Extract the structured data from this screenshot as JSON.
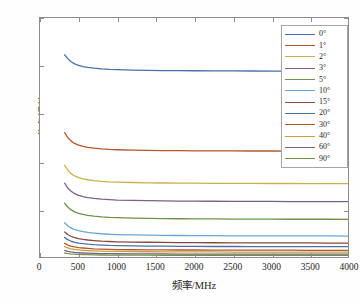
{
  "chart_data": {
    "type": "line",
    "title": "",
    "xlabel": "频率/MHz",
    "ylabel": "仰角误差/mrad",
    "xlim": [
      0,
      4000
    ],
    "ylim": [
      0,
      25
    ],
    "xticks": [
      0,
      500,
      1000,
      1500,
      2000,
      2500,
      3000,
      3500,
      4000
    ],
    "xticklabels": [
      "0",
      "500",
      "1000",
      "1500",
      "2000",
      "2500",
      "3000",
      "3500",
      "4000"
    ],
    "yticks": [
      0,
      5,
      10,
      15,
      20,
      25
    ],
    "yticklabels": [
      "0",
      "5",
      "10",
      "15",
      "20",
      "25"
    ],
    "grid": false,
    "legend_position": "top-right",
    "x": [
      320,
      360,
      400,
      450,
      500,
      560,
      620,
      700,
      800,
      900,
      1000,
      1200,
      1400,
      1600,
      1800,
      2000,
      2250,
      2500,
      2750,
      3000,
      3250,
      3500,
      3750,
      4000
    ],
    "series": [
      {
        "name": "0°",
        "label": "0°",
        "color": "#4a6fa8",
        "values": [
          21.15,
          20.75,
          20.45,
          20.2,
          20.05,
          19.92,
          19.84,
          19.76,
          19.68,
          19.63,
          19.6,
          19.55,
          19.52,
          19.5,
          19.49,
          19.48,
          19.47,
          19.46,
          19.455,
          19.45,
          19.45,
          19.45,
          19.44,
          19.44
        ]
      },
      {
        "name": "1°",
        "label": "1°",
        "color": "#b5562a",
        "values": [
          13.0,
          12.5,
          12.15,
          11.88,
          11.7,
          11.56,
          11.47,
          11.38,
          11.3,
          11.25,
          11.22,
          11.18,
          11.15,
          11.13,
          11.12,
          11.11,
          11.1,
          11.1,
          11.09,
          11.09,
          11.08,
          11.08,
          11.08,
          11.07
        ]
      },
      {
        "name": "2°",
        "label": "2°",
        "color": "#c9b24c",
        "values": [
          9.6,
          9.1,
          8.75,
          8.48,
          8.3,
          8.17,
          8.08,
          7.99,
          7.91,
          7.86,
          7.83,
          7.79,
          7.76,
          7.74,
          7.73,
          7.72,
          7.71,
          7.7,
          7.7,
          7.69,
          7.69,
          7.68,
          7.68,
          7.68
        ]
      },
      {
        "name": "3°",
        "label": "3°",
        "color": "#7a5f8e",
        "values": [
          7.72,
          7.22,
          6.9,
          6.62,
          6.45,
          6.32,
          6.22,
          6.13,
          6.05,
          6.0,
          5.96,
          5.92,
          5.89,
          5.87,
          5.85,
          5.84,
          5.83,
          5.82,
          5.81,
          5.81,
          5.8,
          5.8,
          5.8,
          5.79
        ]
      },
      {
        "name": "5°",
        "label": "5°",
        "color": "#6f9148",
        "values": [
          5.62,
          5.22,
          4.95,
          4.72,
          4.57,
          4.45,
          4.36,
          4.28,
          4.2,
          4.15,
          4.12,
          4.07,
          4.04,
          4.02,
          4.0,
          3.99,
          3.98,
          3.97,
          3.96,
          3.96,
          3.95,
          3.95,
          3.95,
          3.94
        ]
      },
      {
        "name": "10°",
        "label": "10°",
        "color": "#6ba7d4"
      },
      {
        "name": "15°",
        "label": "15°",
        "color": "#8a4a3a"
      },
      {
        "name": "20°",
        "label": "20°",
        "color": "#4a6fa8"
      },
      {
        "name": "30°",
        "label": "30°",
        "color": "#b5562a"
      },
      {
        "name": "40°",
        "label": "40°",
        "color": "#c9a03c"
      },
      {
        "name": "60°",
        "label": "60°",
        "color": "#7a5f8e"
      },
      {
        "name": "90°",
        "label": "90°",
        "color": "#6f9148"
      }
    ],
    "series_extra_values": {
      "10°": [
        3.58,
        3.27,
        3.05,
        2.87,
        2.75,
        2.65,
        2.57,
        2.5,
        2.43,
        2.38,
        2.35,
        2.31,
        2.28,
        2.26,
        2.25,
        2.24,
        2.23,
        2.22,
        2.21,
        2.21,
        2.2,
        2.2,
        2.2,
        2.19
      ],
      "15°": [
        2.62,
        2.35,
        2.17,
        2.02,
        1.92,
        1.84,
        1.78,
        1.72,
        1.66,
        1.62,
        1.59,
        1.56,
        1.54,
        1.52,
        1.51,
        1.5,
        1.49,
        1.48,
        1.48,
        1.47,
        1.47,
        1.47,
        1.46,
        1.46
      ],
      "20°": [
        2.05,
        1.82,
        1.67,
        1.54,
        1.46,
        1.39,
        1.34,
        1.29,
        1.25,
        1.21,
        1.19,
        1.16,
        1.14,
        1.13,
        1.12,
        1.11,
        1.1,
        1.1,
        1.09,
        1.09,
        1.08,
        1.08,
        1.08,
        1.08
      ],
      "30°": [
        1.42,
        1.25,
        1.14,
        1.05,
        0.99,
        0.94,
        0.9,
        0.86,
        0.83,
        0.8,
        0.78,
        0.76,
        0.75,
        0.74,
        0.73,
        0.73,
        0.72,
        0.72,
        0.71,
        0.71,
        0.71,
        0.7,
        0.7,
        0.7
      ],
      "40°": [
        1.08,
        0.95,
        0.86,
        0.79,
        0.74,
        0.7,
        0.67,
        0.64,
        0.61,
        0.59,
        0.58,
        0.56,
        0.55,
        0.54,
        0.54,
        0.53,
        0.53,
        0.52,
        0.52,
        0.52,
        0.52,
        0.51,
        0.51,
        0.51
      ],
      "60°": [
        0.68,
        0.59,
        0.53,
        0.48,
        0.45,
        0.42,
        0.4,
        0.38,
        0.36,
        0.35,
        0.34,
        0.33,
        0.32,
        0.32,
        0.31,
        0.31,
        0.31,
        0.3,
        0.3,
        0.3,
        0.3,
        0.3,
        0.3,
        0.3
      ],
      "90°": [
        0.42,
        0.36,
        0.32,
        0.29,
        0.27,
        0.25,
        0.24,
        0.22,
        0.21,
        0.2,
        0.2,
        0.19,
        0.19,
        0.18,
        0.18,
        0.18,
        0.18,
        0.17,
        0.17,
        0.17,
        0.17,
        0.17,
        0.17,
        0.17
      ]
    },
    "axis_color": "#8c8c8c",
    "background_color": "#ffffff"
  }
}
